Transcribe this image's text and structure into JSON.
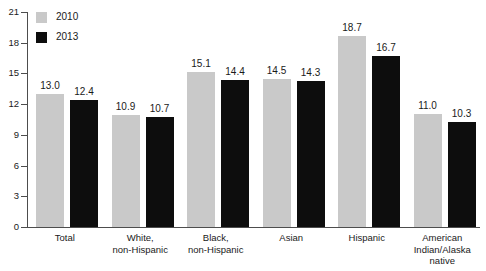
{
  "chart_data": {
    "type": "bar",
    "title": "",
    "subtitle": "",
    "xlabel": "",
    "ylabel": "",
    "ylim": [
      0,
      21
    ],
    "yticks": [
      0,
      3,
      6,
      9,
      12,
      15,
      18,
      21
    ],
    "ytick_labels": [
      "0",
      "3",
      "6",
      "9",
      "12",
      "15",
      "18",
      "21"
    ],
    "grid": false,
    "legend_position": "top-left",
    "categories": [
      "Total",
      "White,\nnon-Hispanic",
      "Black,\nnon-Hispanic",
      "Asian",
      "Hispanic",
      "American\nIndian/Alaska\nnative"
    ],
    "series": [
      {
        "name": "2010",
        "color": "#c9c9c9",
        "values": [
          13.0,
          10.9,
          15.1,
          14.5,
          18.7,
          11.0
        ],
        "labels": [
          "13.0",
          "10.9",
          "15.1",
          "14.5",
          "18.7",
          "11.0"
        ]
      },
      {
        "name": "2013",
        "color": "#0d0d0d",
        "values": [
          12.4,
          10.7,
          14.4,
          14.3,
          16.7,
          10.3
        ],
        "labels": [
          "12.4",
          "10.7",
          "14.4",
          "14.3",
          "16.7",
          "10.3"
        ]
      }
    ]
  },
  "legend": {
    "items": [
      {
        "label": "2010",
        "color": "#c9c9c9"
      },
      {
        "label": "2013",
        "color": "#0d0d0d"
      }
    ]
  },
  "axis": {
    "y_labels": [
      "21",
      "18",
      "15",
      "12",
      "9",
      "6",
      "3",
      "0"
    ]
  },
  "categories_display": [
    {
      "line1": "Total",
      "line2": "",
      "line3": ""
    },
    {
      "line1": "White,",
      "line2": "non-Hispanic",
      "line3": ""
    },
    {
      "line1": "Black,",
      "line2": "non-Hispanic",
      "line3": ""
    },
    {
      "line1": "Asian",
      "line2": "",
      "line3": ""
    },
    {
      "line1": "Hispanic",
      "line2": "",
      "line3": ""
    },
    {
      "line1": "American",
      "line2": "Indian/Alaska",
      "line3": "native"
    }
  ]
}
